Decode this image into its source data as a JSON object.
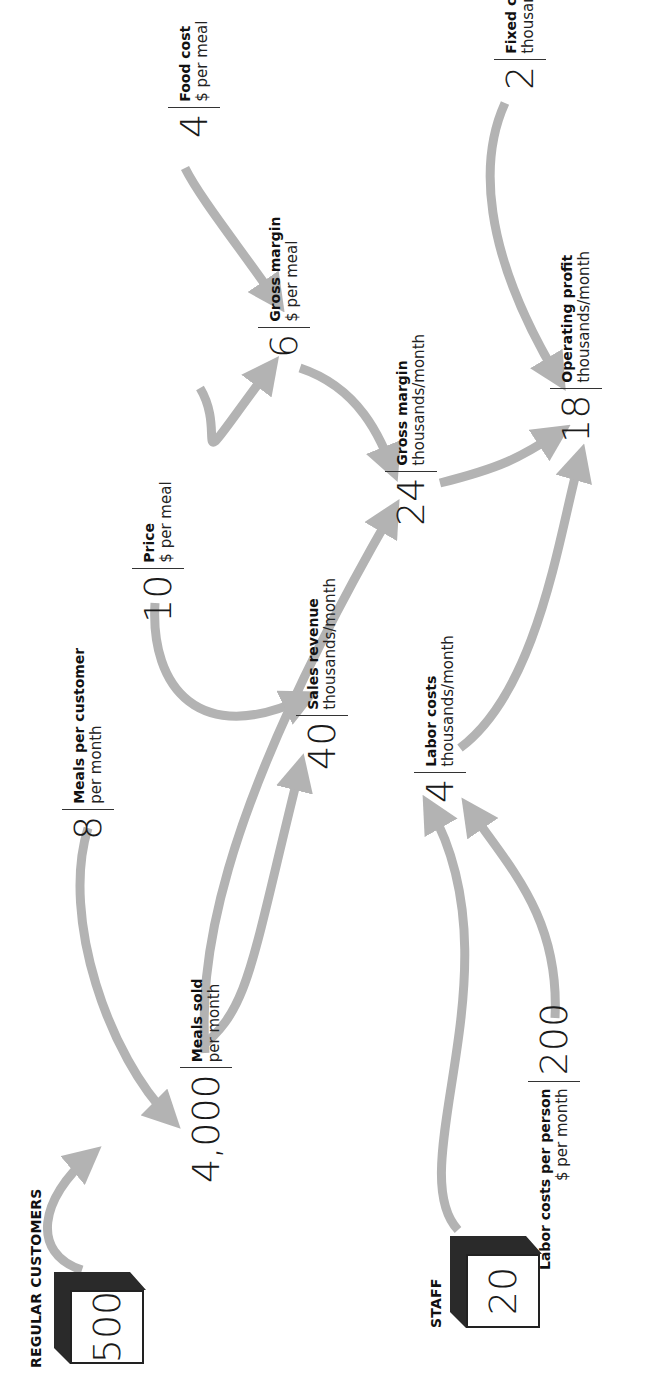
{
  "diagram": {
    "orientation": "rotated -90deg (text reads bottom-to-top)",
    "colors": {
      "arrow": "#b3b3b3",
      "text": "#1a1a1a",
      "cube_shadow": "#2a2a2a",
      "background": "#ffffff"
    },
    "stocks": [
      {
        "id": "regular_customers",
        "title": "REGULAR CUSTOMERS",
        "value": "500"
      },
      {
        "id": "staff",
        "title": "STAFF",
        "value": "20"
      }
    ],
    "nodes": {
      "meals_sold": {
        "value": "4,000",
        "title": "Meals sold",
        "unit": "per month"
      },
      "meals_per_customer": {
        "value": "8",
        "title": "Meals per customer",
        "unit": "per month"
      },
      "sales_revenue": {
        "value": "40",
        "title": "Sales revenue",
        "unit": "thousands/month"
      },
      "price": {
        "value": "10",
        "title": "Price",
        "unit": "$ per meal"
      },
      "gross_margin_total": {
        "value": "24",
        "title": "Gross margin",
        "unit": "thousands/month"
      },
      "gross_margin_per_meal": {
        "value": "6",
        "title": "Gross margin",
        "unit": "$ per meal"
      },
      "food_cost": {
        "value": "4",
        "title": "Food cost",
        "unit": "$ per meal"
      },
      "operating_profit": {
        "value": "18",
        "title": "Operating profit",
        "unit": "thousands/month"
      },
      "fixed_costs": {
        "value": "2",
        "title": "Fixed costs",
        "unit": "thousands/month"
      },
      "labor_costs": {
        "value": "4",
        "title": "Labor costs",
        "unit": "thousands/month"
      },
      "labor_costs_per_person": {
        "value": "200",
        "title": "Labor costs per person",
        "unit": "$ per month"
      }
    },
    "edges": [
      [
        "regular_customers",
        "meals_sold"
      ],
      [
        "meals_per_customer",
        "meals_sold"
      ],
      [
        "meals_sold",
        "sales_revenue"
      ],
      [
        "meals_sold",
        "gross_margin_total"
      ],
      [
        "price",
        "sales_revenue"
      ],
      [
        "price",
        "gross_margin_per_meal"
      ],
      [
        "food_cost",
        "gross_margin_per_meal"
      ],
      [
        "gross_margin_per_meal",
        "gross_margin_total"
      ],
      [
        "gross_margin_total",
        "operating_profit"
      ],
      [
        "fixed_costs",
        "operating_profit"
      ],
      [
        "labor_costs",
        "operating_profit"
      ],
      [
        "staff",
        "labor_costs"
      ],
      [
        "labor_costs_per_person",
        "labor_costs"
      ]
    ]
  }
}
